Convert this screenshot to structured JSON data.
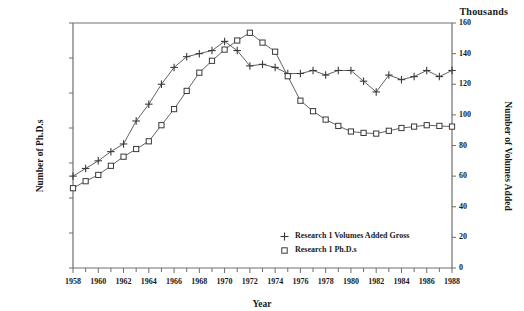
{
  "units_note": "Thousands",
  "axis": {
    "y_left_title": "Number of Ph.D.s",
    "y_right_title": "Number of Volumes Added",
    "x_title": "Year"
  },
  "legend": {
    "items": [
      {
        "label": "Research 1 Volumes Added Gross",
        "marker": "plus-marker",
        "color": "#2b2b2b"
      },
      {
        "label": "Research 1 Ph.D.s",
        "marker": "square-marker",
        "color": "#2b2b2b"
      }
    ]
  },
  "chart_data": {
    "type": "line",
    "title": "",
    "subtitle": "",
    "annotations": [
      "Thousands"
    ],
    "xlabel": "Year",
    "ylabel": "Number of Ph.D.s",
    "y2label": "Number of Volumes Added",
    "grid": false,
    "legend_position": "inside-bottom-right",
    "xlim": [
      1958,
      1988
    ],
    "x_tick_step": 2,
    "x_minor_tick_step": 1,
    "ylim": [
      0,
      350
    ],
    "y_tick_step": 50,
    "y2lim": [
      0,
      160
    ],
    "y2_tick_step": 20,
    "x_tick_labels": [
      "1958",
      "1960",
      "1962",
      "1964",
      "1966",
      "1968",
      "1970",
      "1972",
      "1974",
      "1976",
      "1978",
      "1980",
      "1982",
      "1984",
      "1986",
      "1988"
    ],
    "y_tick_labels": [
      "0",
      "50",
      "100",
      "150",
      "200",
      "250",
      "300",
      "350"
    ],
    "y2_tick_labels": [
      "0",
      "20",
      "40",
      "60",
      "80",
      "100",
      "120",
      "140",
      "160"
    ],
    "x": [
      1958,
      1959,
      1960,
      1961,
      1962,
      1963,
      1964,
      1965,
      1966,
      1967,
      1968,
      1969,
      1970,
      1971,
      1972,
      1973,
      1974,
      1975,
      1976,
      1977,
      1978,
      1979,
      1980,
      1981,
      1982,
      1983,
      1984,
      1985,
      1986,
      1987,
      1988
    ],
    "series": [
      {
        "name": "Research 1 Volumes Added Gross",
        "axis": "right",
        "marker": "plus",
        "values": [
          60,
          65,
          70,
          76,
          81,
          96,
          107,
          120,
          131,
          138,
          140,
          142,
          148,
          142,
          132,
          133,
          131,
          127,
          127,
          129,
          126,
          129,
          129,
          122,
          115,
          126,
          123,
          125,
          129,
          125,
          129
        ]
      },
      {
        "name": "Research 1 Ph.D.s",
        "axis": "left",
        "marker": "square",
        "values": [
          114,
          124,
          133,
          146,
          159,
          170,
          181,
          204,
          227,
          253,
          279,
          296,
          312,
          325,
          336,
          322,
          309,
          274,
          239,
          224,
          212,
          203,
          195,
          193,
          192,
          196,
          200,
          202,
          204,
          203,
          202
        ]
      }
    ]
  }
}
